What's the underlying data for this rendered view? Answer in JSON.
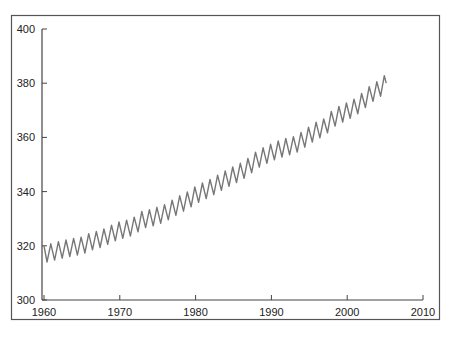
{
  "chart_data": {
    "type": "line",
    "title": "",
    "xlabel": "",
    "ylabel": "",
    "xlim": [
      1960,
      2010
    ],
    "ylim": [
      300,
      400
    ],
    "x_ticks": [
      "1960",
      "1970",
      "1980",
      "1990",
      "2000",
      "2010"
    ],
    "y_ticks": [
      "300",
      "320",
      "340",
      "360",
      "380",
      "400"
    ],
    "grid": false,
    "legend": null,
    "series": [
      {
        "name": "Atmospheric CO2 (ppm), seasonal cycle",
        "color": "#777777",
        "annual_x": [
          1960,
          1961,
          1962,
          1963,
          1964,
          1965,
          1966,
          1967,
          1968,
          1969,
          1970,
          1971,
          1972,
          1973,
          1974,
          1975,
          1976,
          1977,
          1978,
          1979,
          1980,
          1981,
          1982,
          1983,
          1984,
          1985,
          1986,
          1987,
          1988,
          1989,
          1990,
          1991,
          1992,
          1993,
          1994,
          1995,
          1996,
          1997,
          1998,
          1999,
          2000,
          2001,
          2002,
          2003,
          2004,
          2005
        ],
        "annual_mean": [
          317.0,
          317.6,
          318.4,
          319.0,
          319.6,
          320.0,
          321.4,
          322.2,
          323.1,
          324.6,
          325.7,
          326.3,
          327.5,
          329.7,
          330.2,
          331.1,
          332.1,
          333.8,
          335.4,
          336.8,
          338.7,
          340.1,
          341.4,
          343.0,
          344.6,
          346.0,
          347.4,
          349.2,
          351.6,
          353.1,
          354.4,
          355.6,
          356.5,
          357.1,
          358.8,
          360.8,
          362.6,
          363.7,
          366.7,
          368.4,
          369.6,
          371.1,
          373.2,
          375.8,
          377.5,
          379.8
        ],
        "seasonal_amplitude": 3.2,
        "start_value": 320,
        "end_value": 380,
        "max_peak": 383
      }
    ]
  }
}
